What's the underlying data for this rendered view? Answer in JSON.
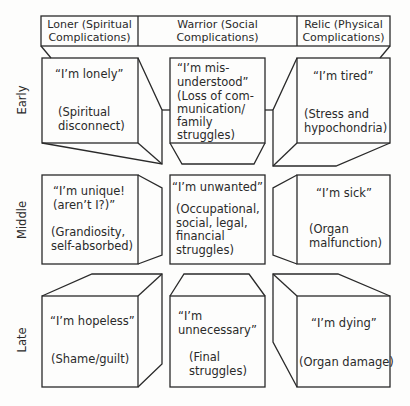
{
  "header": {
    "columns": [
      {
        "label": "Loner (Spiritual\nComplications)"
      },
      {
        "label": "Warrior (Social\nComplications)"
      },
      {
        "label": "Relic (Physical\nComplications)"
      }
    ]
  },
  "rows": [
    {
      "label": "Early"
    },
    {
      "label": "Middle"
    },
    {
      "label": "Late"
    }
  ],
  "cells": {
    "early_loner": {
      "quote": "“I’m lonely”",
      "desc": "(Spiritual\ndisconnect)"
    },
    "early_warrior": {
      "quote": "“I’m mis-\nunderstood”",
      "desc": "(Loss of com-\nmunication/\nfamily\nstruggles)"
    },
    "early_relic": {
      "quote": "“I’m tired”",
      "desc": "(Stress and\nhypochondria)"
    },
    "middle_loner": {
      "quote": "“I’m unique!\n(aren’t I?)”",
      "desc": "(Grandiosity,\nself-absorbed)"
    },
    "middle_warrior": {
      "quote": "“I’m unwanted”",
      "desc": "(Occupational,\nsocial, legal,\nfinancial\nstruggles)"
    },
    "middle_relic": {
      "quote": "“I’m sick”",
      "desc": "(Organ\nmalfunction)"
    },
    "late_loner": {
      "quote": "“I’m hopeless”",
      "desc": "(Shame/guilt)"
    },
    "late_warrior": {
      "quote": "“I’m\nunnecessary”",
      "desc": "(Final\nstruggles)"
    },
    "late_relic": {
      "quote": "“I’m dying”",
      "desc": "(Organ damage)"
    }
  },
  "colors": {
    "line": "#2a2a2a",
    "background": "#fdfdfc"
  }
}
